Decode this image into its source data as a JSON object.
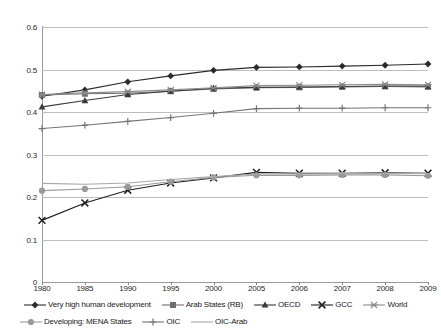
{
  "chart_data": {
    "type": "line",
    "title": "",
    "subtitle": "",
    "xlabel": "",
    "ylabel": "",
    "grid": true,
    "legend_position": "bottom",
    "categories": [
      "1980",
      "1985",
      "1990",
      "1995",
      "2000",
      "2005",
      "2006",
      "2007",
      "2008",
      "2009"
    ],
    "xlim": [
      "1980",
      "2009"
    ],
    "ylim": [
      0,
      0.6
    ],
    "ytick_labels": [
      "0",
      "0.1",
      "0.2",
      "0.3",
      "0.4",
      "0.5",
      "0.6"
    ],
    "ytick_values": [
      0,
      0.1,
      0.2,
      0.3,
      0.4,
      0.5,
      0.6
    ],
    "series": [
      {
        "name": "Very high human development",
        "marker": "diamond",
        "color": "#2b2b2b",
        "values": [
          0.437,
          0.452,
          0.471,
          0.485,
          0.498,
          0.505,
          0.506,
          0.508,
          0.51,
          0.513
        ]
      },
      {
        "name": "Arab States (RB)",
        "marker": "square",
        "color": "#6e6e6e",
        "values": [
          0.44,
          0.443,
          0.444,
          0.449,
          0.454,
          0.457,
          0.458,
          0.459,
          0.46,
          0.459
        ]
      },
      {
        "name": "OECD",
        "marker": "triangle",
        "color": "#3a3a3a",
        "values": [
          0.412,
          0.427,
          0.441,
          0.449,
          0.456,
          0.458,
          0.459,
          0.46,
          0.461,
          0.461
        ]
      },
      {
        "name": "GCC",
        "marker": "cross",
        "color": "#1f1f1f",
        "values": [
          0.145,
          0.186,
          0.216,
          0.233,
          0.245,
          0.258,
          0.256,
          0.256,
          0.257,
          0.256
        ]
      },
      {
        "name": "World",
        "marker": "asterisk",
        "color": "#8c8c8c",
        "values": [
          0.441,
          0.445,
          0.448,
          0.452,
          0.457,
          0.462,
          0.463,
          0.464,
          0.465,
          0.464
        ]
      },
      {
        "name": "Developing: MENA States",
        "marker": "circle",
        "color": "#9a9a9a",
        "values": [
          0.215,
          0.219,
          0.224,
          0.236,
          0.246,
          0.251,
          0.251,
          0.252,
          0.252,
          0.25
        ]
      },
      {
        "name": "OIC",
        "marker": "plus",
        "color": "#767676",
        "values": [
          0.361,
          0.369,
          0.378,
          0.387,
          0.397,
          0.408,
          0.409,
          0.409,
          0.41,
          0.41
        ]
      },
      {
        "name": "OIC-Arab",
        "marker": "none",
        "color": "#a8a8a8",
        "values": [
          0.232,
          0.23,
          0.233,
          0.241,
          0.248,
          0.254,
          0.254,
          0.255,
          0.256,
          0.255
        ]
      }
    ]
  },
  "legend": {
    "row1": [
      "Very high human development",
      "Arab States (RB)",
      "OECD",
      "GCC",
      "World"
    ],
    "row2": [
      "Developing: MENA States",
      "OIC",
      "OIC-Arab"
    ]
  }
}
